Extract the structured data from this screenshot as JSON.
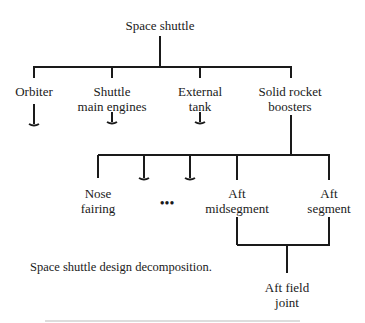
{
  "diagram": {
    "root": {
      "label": "Space shuttle"
    },
    "level1": [
      {
        "label": "Orbiter",
        "collapsed": true
      },
      {
        "label": "Shuttle\nmain engines",
        "collapsed": true
      },
      {
        "label": "External\ntank",
        "collapsed": true
      },
      {
        "label": "Solid rocket\nboosters",
        "collapsed": false
      }
    ],
    "level2": [
      {
        "label": "Nose\nfairing"
      },
      {
        "label": "",
        "collapsed": true
      },
      {
        "label": "",
        "collapsed": true
      },
      {
        "label": "Aft\nmidsegment"
      },
      {
        "label": "Aft\nsegment"
      }
    ],
    "ellipsis": "•••",
    "level3": [
      {
        "label": "Aft field\njoint"
      }
    ],
    "caption": "Space shuttle design decomposition."
  }
}
